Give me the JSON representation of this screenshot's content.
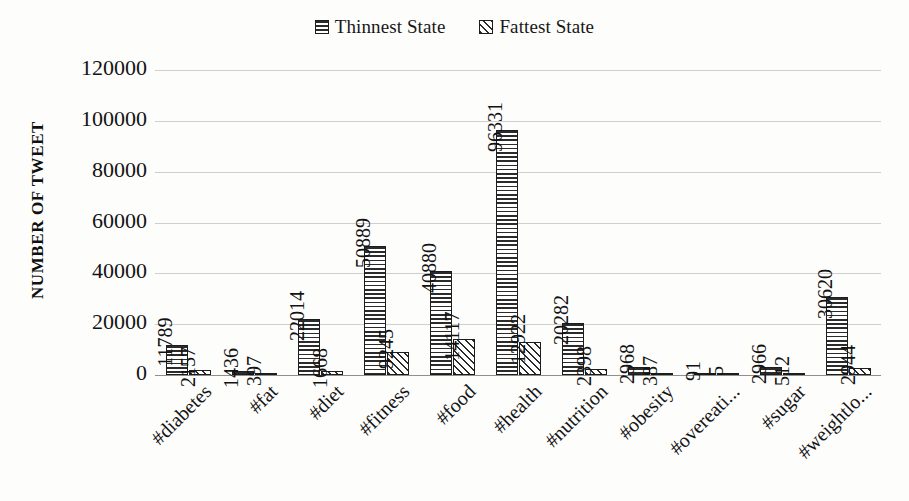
{
  "chart_data": {
    "type": "bar",
    "title": "",
    "xlabel": "",
    "ylabel": "NUMBER OF TWEET",
    "ylim": [
      0,
      120000
    ],
    "ytick_labels": [
      "120000",
      "100000",
      "80000",
      "60000",
      "40000",
      "20000",
      "0"
    ],
    "ytick_values": [
      120000,
      100000,
      80000,
      60000,
      40000,
      20000,
      0
    ],
    "grid": true,
    "legend_position": "top-right",
    "categories": [
      "#diabetes",
      "#fat",
      "#diet",
      "#fitness",
      "#food",
      "#health",
      "#nutrition",
      "#obesity",
      "#overeati...",
      "#sugar",
      "#weightlo..."
    ],
    "series": [
      {
        "name": "Thinnest State",
        "pattern": "horizontal-lines",
        "values": [
          11789,
          1436,
          22014,
          50889,
          40880,
          96331,
          20282,
          2968,
          91,
          2966,
          30620
        ],
        "labels": [
          "11789",
          "1436",
          "22014",
          "50889",
          "40880",
          "96331",
          "20282",
          "2968",
          "91",
          "2966",
          "30620"
        ]
      },
      {
        "name": "Fattest State",
        "pattern": "diagonal-hatch",
        "values": [
          2157,
          397,
          1668,
          9245,
          14117,
          12922,
          2398,
          387,
          5,
          512,
          2944
        ],
        "labels": [
          "2157",
          "397",
          "1668",
          "9245",
          "14117",
          "12922",
          "2398",
          "387",
          "5",
          "512",
          "2944"
        ]
      }
    ],
    "colors": {
      "bar_outline": "#1d1d1d",
      "bar_fill": "#ffffff",
      "hatch": "#2b2b2b",
      "gridline": "#cfcfcf",
      "axis": "#8f8f8f",
      "background": "#fdfdfc",
      "text": "#131313"
    }
  }
}
